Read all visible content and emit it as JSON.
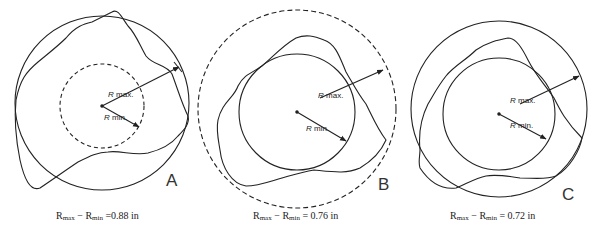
{
  "figure": {
    "panels": [
      {
        "id": "A",
        "letter": "A",
        "outer_circle": "solid",
        "inner_circle": "dashed",
        "r_max_label": "max.",
        "r_min_label": "min.",
        "r_symbol": "R",
        "caption": {
          "r": "R",
          "max_sub": "max",
          "min_sub": "min",
          "value": "0.88 in",
          "operator": "−",
          "equals": "="
        }
      },
      {
        "id": "B",
        "letter": "B",
        "outer_circle": "dashed",
        "inner_circle": "solid",
        "r_max_label": "max.",
        "r_min_label": "min.",
        "r_symbol": "R",
        "caption": {
          "r": "R",
          "max_sub": "max",
          "min_sub": "min",
          "value": "0.76 in",
          "operator": "−",
          "equals": "="
        }
      },
      {
        "id": "C",
        "letter": "C",
        "outer_circle": "solid",
        "inner_circle": "solid",
        "r_max_label": "max.",
        "r_min_label": "min.",
        "r_symbol": "R",
        "caption": {
          "r": "R",
          "max_sub": "max",
          "min_sub": "min",
          "value": "0.72 in",
          "operator": "−",
          "equals": "="
        }
      }
    ],
    "colors": {
      "line": "#222222",
      "background": "#ffffff"
    }
  }
}
